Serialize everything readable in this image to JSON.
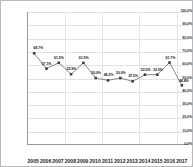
{
  "chart_data": {
    "type": "line",
    "title": "",
    "subtitle": "",
    "xlabel": "",
    "ylabel": "",
    "categories": [
      "2005",
      "2006",
      "2007",
      "2008",
      "2009",
      "2010",
      "2011",
      "2012",
      "2013",
      "2014",
      "2015",
      "2016",
      "2017"
    ],
    "values": [
      68.7,
      57.1,
      61.5,
      52.9,
      61.5,
      50.0,
      48.2,
      50.0,
      47.5,
      52.5,
      52.5,
      61.7,
      44.4
    ],
    "point_labels": [
      "68.7%",
      "57.1%",
      "61.5%",
      "52.9%",
      "61.5%",
      "50.0%",
      "48.2%",
      "50.0%",
      "47.5%",
      "52.5%",
      "52.5%",
      "61.7%",
      "44.4%"
    ],
    "ylim": [
      0,
      100
    ],
    "ytick_values": [
      100.0,
      90.0,
      80.0,
      70.0,
      60.0,
      50.0,
      40.0,
      30.0,
      20.0,
      10.0,
      0.0
    ],
    "ytick_labels": [
      "100.0%",
      "90.0%",
      "80.0%",
      "70.0%",
      "60.0%",
      "50.0%",
      "40.0%",
      "30.0%",
      "20.0%",
      "10.0%",
      "0.0%"
    ],
    "grid": true,
    "legend": false,
    "series_color": "#595959",
    "marker_color": "#3f3f3f",
    "grid_color": "#e2e2e2",
    "axis_color": "#9a9a9a",
    "border_color": "#b9b9b9",
    "background": "#ffffff"
  }
}
